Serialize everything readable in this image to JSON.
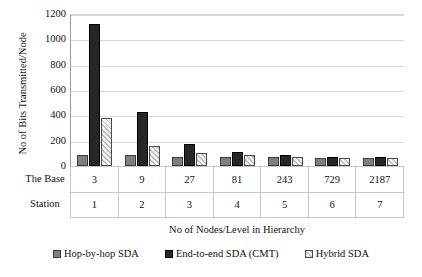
{
  "chart_data": {
    "type": "bar",
    "title": "",
    "xlabel": "No of Nodes/Level in Hierarchy",
    "ylabel": "No of Bits Transmitted/Node",
    "ylim": [
      0,
      1200
    ],
    "yticks": [
      1200,
      1000,
      800,
      600,
      400,
      200,
      0
    ],
    "grid": true,
    "legend_position": "bottom",
    "categories": [
      "3",
      "9",
      "27",
      "81",
      "243",
      "729",
      "2187"
    ],
    "secondary_categories": [
      "1",
      "2",
      "3",
      "4",
      "5",
      "6",
      "7"
    ],
    "category_row_label": [
      "The Base",
      "Station"
    ],
    "series": [
      {
        "name": "Hop-by-hop SDA",
        "values": [
          85,
          85,
          75,
          75,
          70,
          65,
          62
        ]
      },
      {
        "name": "End-to-end SDA (CMT)",
        "values": [
          1120,
          425,
          175,
          110,
          85,
          75,
          68
        ]
      },
      {
        "name": "Hybrid SDA",
        "values": [
          380,
          155,
          105,
          85,
          72,
          66,
          62
        ]
      }
    ],
    "colors": {
      "series0": "#7f7f7f",
      "series1": "#262626",
      "series2": "#f1f1f1",
      "gridline": "#d9d9d9",
      "axis": "#9a9a9a"
    }
  }
}
